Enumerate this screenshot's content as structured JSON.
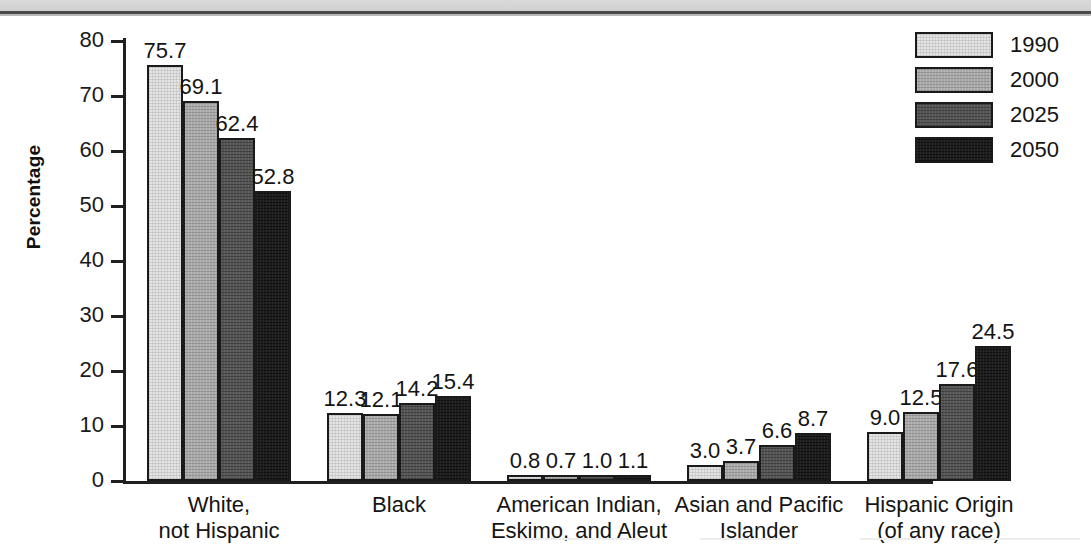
{
  "chart_data": {
    "type": "bar",
    "title": "",
    "xlabel": "",
    "ylabel": "Percentage",
    "ylim": [
      0,
      80
    ],
    "yticks": [
      0,
      10,
      20,
      30,
      40,
      50,
      60,
      70,
      80
    ],
    "ytick_labels": [
      "0",
      "10",
      "20",
      "30",
      "40",
      "50",
      "60",
      "70",
      "80"
    ],
    "grid": false,
    "legend_position": "top-right",
    "categories": [
      "White,\nnot Hispanic",
      "Black",
      "American Indian,\nEskimo, and Aleut",
      "Asian and Pacific\nIslander",
      "Hispanic Origin\n(of any race)"
    ],
    "category_lines": [
      [
        "White,",
        "not Hispanic"
      ],
      [
        "Black",
        ""
      ],
      [
        "American Indian,",
        "Eskimo, and Aleut"
      ],
      [
        "Asian and Pacific",
        "Islander"
      ],
      [
        "Hispanic Origin",
        "(of any race)"
      ]
    ],
    "series": [
      {
        "name": "1990",
        "color": "#e3e3e3",
        "values": [
          75.7,
          12.3,
          0.8,
          3.0,
          9.0
        ],
        "labels": [
          "75.7",
          "12.3",
          "0.8",
          "3.0",
          "9.0"
        ]
      },
      {
        "name": "2000",
        "color": "#a9a9a9",
        "values": [
          69.1,
          12.1,
          0.7,
          3.7,
          12.5
        ],
        "labels": [
          "69.1",
          "12.1",
          "0.7",
          "3.7",
          "12.5"
        ]
      },
      {
        "name": "2025",
        "color": "#565656",
        "values": [
          62.4,
          14.2,
          1.0,
          6.6,
          17.6
        ],
        "labels": [
          "62.4",
          "14.2",
          "1.0",
          "6.6",
          "17.6"
        ]
      },
      {
        "name": "2050",
        "color": "#1d1d1d",
        "values": [
          52.8,
          15.4,
          1.1,
          8.7,
          24.5
        ],
        "labels": [
          "52.8",
          "15.4",
          "1.1",
          "8.7",
          "24.5"
        ]
      }
    ]
  },
  "legend": {
    "items": [
      {
        "label": "1990"
      },
      {
        "label": "2000"
      },
      {
        "label": "2025"
      },
      {
        "label": "2050"
      }
    ]
  },
  "axis": {
    "y_title": "Percentage"
  }
}
